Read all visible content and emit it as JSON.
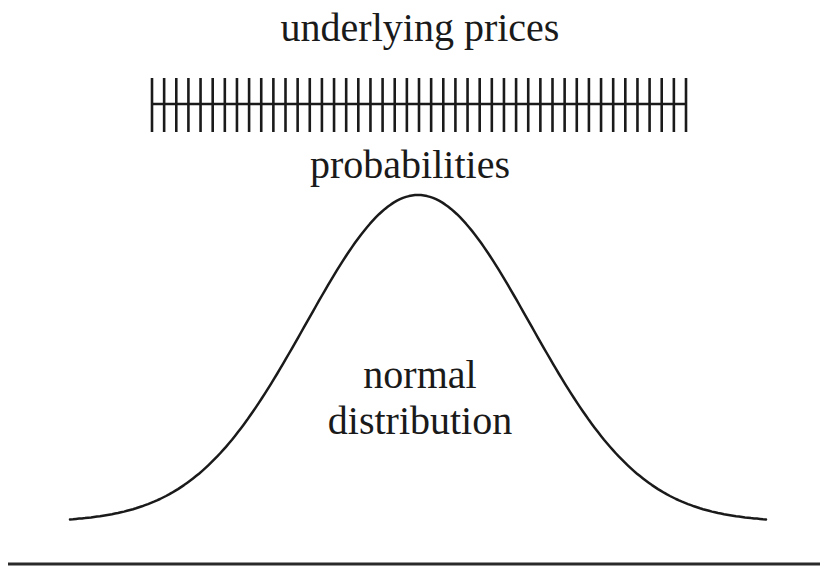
{
  "diagram": {
    "title": "underlying prices",
    "subtitle": "probabilities",
    "curve_label_line1": "normal",
    "curve_label_line2": "distribution",
    "tick_count": 45,
    "colors": {
      "stroke": "#1a1a1a",
      "background": "#ffffff"
    }
  }
}
